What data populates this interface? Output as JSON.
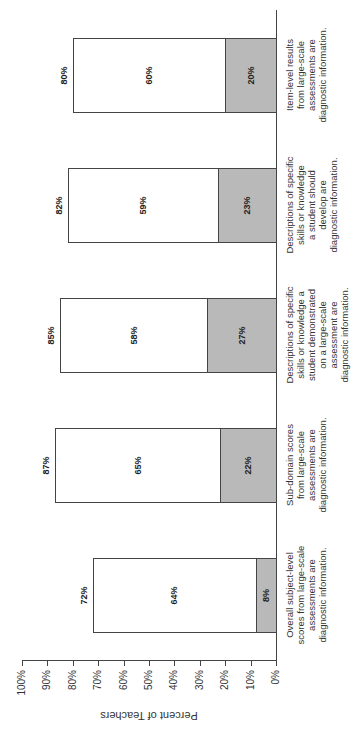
{
  "chart_data": {
    "type": "bar",
    "stacked": true,
    "orientation": "vertical (page rotated 90° clockwise)",
    "title": "",
    "xlabel": "",
    "ylabel": "Percent of Teachers",
    "ylim": [
      0,
      100
    ],
    "yticks": [
      "0%",
      "10%",
      "20%",
      "30%",
      "40%",
      "50%",
      "60%",
      "70%",
      "80%",
      "90%",
      "100%"
    ],
    "grid": false,
    "legend": null,
    "categories": [
      "Overall subject-level scores from large-scale assessments are diagnostic information.",
      "Sub-domain scores from large-scale assessments are diagnostic information.",
      "Descriptions of specific skills or knowledge a student demonstrated on a large-scale assessment are diagnostic information.",
      "Descriptions of specific skills or knowledge a student should develop are diagnostic information.",
      "Item-level results from large-scale assessments are diagnostic information."
    ],
    "series": [
      {
        "name": "Strongly agree (gray, bottom)",
        "color": "#b9b9b9",
        "values": [
          8,
          22,
          27,
          23,
          20
        ]
      },
      {
        "name": "Agree (white, top)",
        "color": "#ffffff",
        "values": [
          64,
          65,
          58,
          59,
          60
        ]
      }
    ],
    "totals": [
      72,
      87,
      85,
      82,
      80
    ]
  },
  "axis": {
    "title": "Percent of Teachers",
    "ticks": [
      "0%",
      "10%",
      "20%",
      "30%",
      "40%",
      "50%",
      "60%",
      "70%",
      "80%",
      "90%",
      "100%"
    ]
  },
  "bars": [
    {
      "label_lines": [
        "Overall subject-level",
        "scores from large-scale",
        "assessments are",
        "diagnostic information."
      ],
      "gray": "8%",
      "white": "64%",
      "total": "72%"
    },
    {
      "label_lines": [
        "Sub-domain scores",
        "from large-scale",
        "assessments are",
        "diagnostic information."
      ],
      "gray": "22%",
      "white": "65%",
      "total": "87%"
    },
    {
      "label_lines": [
        "Descriptions of specific",
        "skills or knowledge a",
        "student demonstrated",
        "on a large-scale",
        "assessment are",
        "diagnostic information."
      ],
      "gray": "27%",
      "white": "58%",
      "total": "85%"
    },
    {
      "label_lines": [
        "Descriptions of specific",
        "skills or knowledge",
        "a student should",
        "develop are",
        "diagnostic information."
      ],
      "gray": "23%",
      "white": "59%",
      "total": "82%"
    },
    {
      "label_lines": [
        "Item-level results",
        "from large-scale",
        "assessments are",
        "diagnostic information."
      ],
      "gray": "20%",
      "white": "60%",
      "total": "80%"
    }
  ]
}
